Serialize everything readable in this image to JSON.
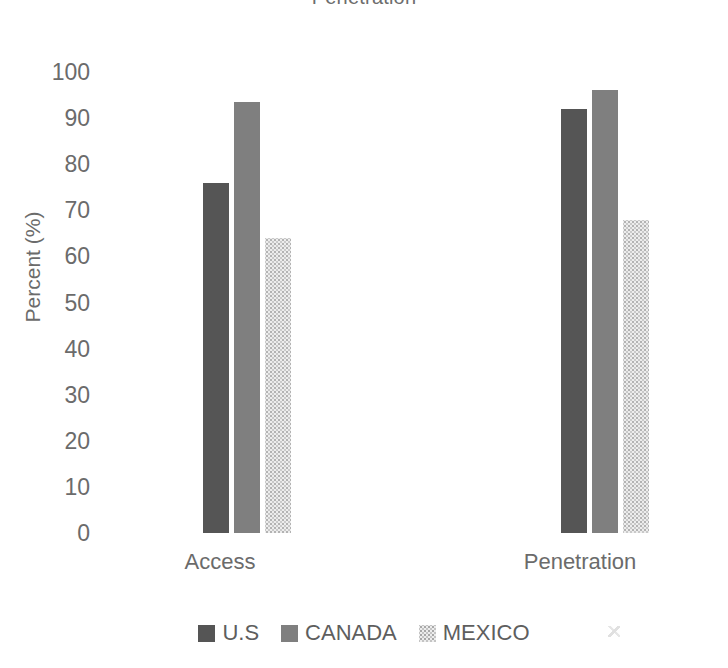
{
  "chart_data": {
    "type": "bar",
    "title": "Penetration",
    "xlabel": "",
    "ylabel": "Percent (%)",
    "categories": [
      "Access",
      "Penetration"
    ],
    "series": [
      {
        "name": "U.S",
        "color": "#555555",
        "values": [
          76,
          92
        ]
      },
      {
        "name": "CANADA",
        "color": "#7f7f7f",
        "values": [
          93.5,
          96
        ]
      },
      {
        "name": "MEXICO",
        "color": "#ededed",
        "values": [
          64,
          68
        ]
      }
    ],
    "ylim": [
      0,
      100
    ],
    "ytick_step": 10,
    "yticks": [
      "100",
      "90",
      "80",
      "70",
      "60",
      "50",
      "40",
      "30",
      "20",
      "10",
      "0"
    ],
    "grid": false,
    "legend_position": "bottom",
    "legend_entries": [
      "U.S",
      "CANADA",
      "MEXICO"
    ]
  }
}
